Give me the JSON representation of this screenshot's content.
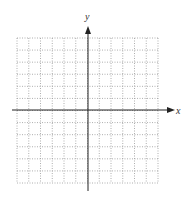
{
  "diagram": {
    "type": "coordinate-plane",
    "x_axis_label": "x",
    "y_axis_label": "y",
    "grid": {
      "columns": 12,
      "rows": 12,
      "style": "dotted"
    },
    "colors": {
      "axis": "#222222",
      "grid": "#9a9a9a",
      "background": "#ffffff"
    }
  }
}
